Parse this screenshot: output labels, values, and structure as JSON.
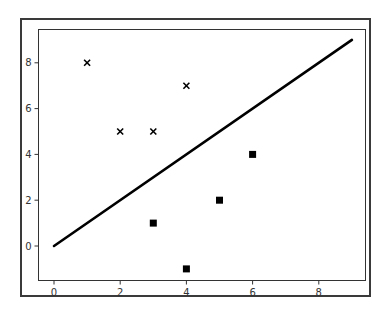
{
  "chart_data": {
    "type": "scatter",
    "title": "",
    "xlabel": "",
    "ylabel": "",
    "xlim": [
      -0.45,
      9.45
    ],
    "ylim": [
      -1.5,
      9.5
    ],
    "grid": false,
    "legend": null,
    "xticks": [
      0,
      2,
      4,
      6,
      8
    ],
    "yticks": [
      0,
      2,
      4,
      6,
      8
    ],
    "series": [
      {
        "name": "class_x",
        "marker": "x",
        "color": "#000000",
        "points": [
          [
            1,
            8
          ],
          [
            2,
            5
          ],
          [
            3,
            5
          ],
          [
            4,
            7
          ]
        ]
      },
      {
        "name": "class_square",
        "marker": "s",
        "color": "#000000",
        "points": [
          [
            3,
            1
          ],
          [
            4,
            -1
          ],
          [
            5,
            2
          ],
          [
            6,
            4
          ]
        ]
      },
      {
        "name": "decision_line",
        "type": "line",
        "color": "#000000",
        "points": [
          [
            0,
            0
          ],
          [
            9,
            9
          ]
        ]
      }
    ]
  }
}
